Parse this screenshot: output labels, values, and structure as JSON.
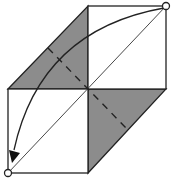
{
  "diagram": {
    "type": "origami-fold-step",
    "colors": {
      "shaded": "#8c8c8c",
      "paper": "#ffffff",
      "line": "#222222"
    },
    "points": {
      "top_corner": [
        166,
        6
      ],
      "bottom_corner": [
        8,
        173
      ]
    },
    "annotations": {
      "fold_arrow": "curved arrow from top-right corner to bottom-left corner",
      "valley_fold": "dashed crease line"
    }
  }
}
